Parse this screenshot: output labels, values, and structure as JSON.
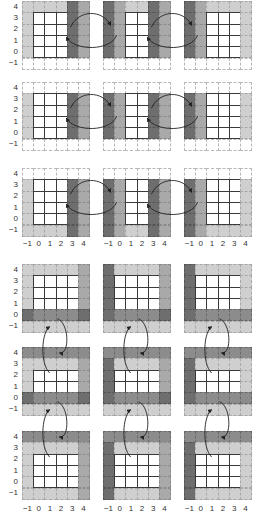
{
  "figure": {
    "axis": {
      "x_ticks": [
        "−1",
        "0",
        "1",
        "2",
        "3",
        "4"
      ],
      "y_ticks": [
        "4",
        "3",
        "2",
        "1",
        "0",
        "−1"
      ]
    },
    "colors": {
      "white": "#ffffff",
      "light": "#cfcfcf",
      "medium": "#a9a9a9",
      "dark": "#6e6e6e",
      "line": "#3a3a3a",
      "arrow": "#222222"
    },
    "grid_origin_x": [
      22,
      103,
      184
    ],
    "cell_w": 11.2,
    "cell_h": 11.3,
    "top_section": {
      "row_y": [
        1,
        82,
        168
      ],
      "xlabel_y": 240,
      "swap_direction": "horizontal",
      "rows": [
        {
          "grids": [
            [
              [
                "1",
                "1",
                "1",
                "1",
                "3",
                "2"
              ],
              [
                "1",
                "W",
                "W",
                "W",
                "3",
                "2"
              ],
              [
                "1",
                "W",
                "W",
                "W",
                "3",
                "2"
              ],
              [
                "1",
                "W",
                "W",
                "W",
                "3",
                "2"
              ],
              [
                "1",
                "W",
                "W",
                "W",
                "3",
                "2"
              ],
              [
                "0",
                "0",
                "0",
                "0",
                "0",
                "0"
              ]
            ],
            [
              [
                "3",
                "2",
                "1",
                "1",
                "3",
                "2"
              ],
              [
                "3",
                "2",
                "W",
                "W",
                "3",
                "2"
              ],
              [
                "3",
                "2",
                "W",
                "W",
                "3",
                "2"
              ],
              [
                "3",
                "2",
                "W",
                "W",
                "3",
                "2"
              ],
              [
                "3",
                "2",
                "W",
                "W",
                "3",
                "2"
              ],
              [
                "0",
                "0",
                "0",
                "0",
                "0",
                "0"
              ]
            ],
            [
              [
                "3",
                "2",
                "1",
                "1",
                "1",
                "1"
              ],
              [
                "3",
                "2",
                "W",
                "W",
                "W",
                "1"
              ],
              [
                "3",
                "2",
                "W",
                "W",
                "W",
                "1"
              ],
              [
                "3",
                "2",
                "W",
                "W",
                "W",
                "1"
              ],
              [
                "3",
                "2",
                "W",
                "W",
                "W",
                "1"
              ],
              [
                "0",
                "0",
                "0",
                "0",
                "0",
                "0"
              ]
            ]
          ]
        },
        {
          "grids": [
            [
              [
                "0",
                "0",
                "0",
                "0",
                "0",
                "0"
              ],
              [
                "1",
                "W",
                "W",
                "W",
                "3",
                "2"
              ],
              [
                "1",
                "W",
                "W",
                "W",
                "3",
                "2"
              ],
              [
                "1",
                "W",
                "W",
                "W",
                "3",
                "2"
              ],
              [
                "1",
                "W",
                "W",
                "W",
                "3",
                "2"
              ],
              [
                "0",
                "0",
                "0",
                "0",
                "0",
                "0"
              ]
            ],
            [
              [
                "0",
                "0",
                "0",
                "0",
                "0",
                "0"
              ],
              [
                "3",
                "2",
                "W",
                "W",
                "3",
                "2"
              ],
              [
                "3",
                "2",
                "W",
                "W",
                "3",
                "2"
              ],
              [
                "3",
                "2",
                "W",
                "W",
                "3",
                "2"
              ],
              [
                "3",
                "2",
                "W",
                "W",
                "3",
                "2"
              ],
              [
                "0",
                "0",
                "0",
                "0",
                "0",
                "0"
              ]
            ],
            [
              [
                "0",
                "0",
                "0",
                "0",
                "0",
                "0"
              ],
              [
                "3",
                "2",
                "W",
                "W",
                "W",
                "1"
              ],
              [
                "3",
                "2",
                "W",
                "W",
                "W",
                "1"
              ],
              [
                "3",
                "2",
                "W",
                "W",
                "W",
                "1"
              ],
              [
                "3",
                "2",
                "W",
                "W",
                "W",
                "1"
              ],
              [
                "0",
                "0",
                "0",
                "0",
                "0",
                "0"
              ]
            ]
          ]
        },
        {
          "grids": [
            [
              [
                "0",
                "0",
                "0",
                "0",
                "0",
                "0"
              ],
              [
                "1",
                "W",
                "W",
                "W",
                "3",
                "2"
              ],
              [
                "1",
                "W",
                "W",
                "W",
                "3",
                "2"
              ],
              [
                "1",
                "W",
                "W",
                "W",
                "3",
                "2"
              ],
              [
                "1",
                "W",
                "W",
                "W",
                "3",
                "2"
              ],
              [
                "1",
                "1",
                "1",
                "1",
                "3",
                "2"
              ]
            ],
            [
              [
                "0",
                "0",
                "0",
                "0",
                "0",
                "0"
              ],
              [
                "3",
                "2",
                "W",
                "W",
                "3",
                "2"
              ],
              [
                "3",
                "2",
                "W",
                "W",
                "3",
                "2"
              ],
              [
                "3",
                "2",
                "W",
                "W",
                "3",
                "2"
              ],
              [
                "3",
                "2",
                "W",
                "W",
                "3",
                "2"
              ],
              [
                "3",
                "2",
                "1",
                "1",
                "3",
                "2"
              ]
            ],
            [
              [
                "0",
                "0",
                "0",
                "0",
                "0",
                "0"
              ],
              [
                "3",
                "2",
                "W",
                "W",
                "W",
                "1"
              ],
              [
                "3",
                "2",
                "W",
                "W",
                "W",
                "1"
              ],
              [
                "3",
                "2",
                "W",
                "W",
                "W",
                "1"
              ],
              [
                "3",
                "2",
                "W",
                "W",
                "W",
                "1"
              ],
              [
                "3",
                "2",
                "1",
                "1",
                "1",
                "1"
              ]
            ]
          ]
        }
      ]
    },
    "bottom_section": {
      "row_y": [
        264,
        347,
        431
      ],
      "xlabel_y": 505,
      "swap_direction": "vertical",
      "rows": [
        {
          "grids": [
            [
              [
                "1",
                "1",
                "1",
                "1",
                "1",
                "2"
              ],
              [
                "1",
                "W",
                "W",
                "W",
                "W",
                "2"
              ],
              [
                "1",
                "W",
                "W",
                "W",
                "W",
                "2"
              ],
              [
                "1",
                "W",
                "W",
                "W",
                "W",
                "2"
              ],
              [
                "3",
                "4",
                "4",
                "4",
                "4",
                "3"
              ],
              [
                "1",
                "1",
                "1",
                "1",
                "1",
                "1"
              ]
            ],
            [
              [
                "3",
                "1",
                "1",
                "1",
                "1",
                "2"
              ],
              [
                "3",
                "W",
                "W",
                "W",
                "W",
                "2"
              ],
              [
                "3",
                "W",
                "W",
                "W",
                "W",
                "2"
              ],
              [
                "3",
                "W",
                "W",
                "W",
                "W",
                "2"
              ],
              [
                "3",
                "4",
                "4",
                "4",
                "4",
                "3"
              ],
              [
                "1",
                "1",
                "1",
                "1",
                "1",
                "1"
              ]
            ],
            [
              [
                "3",
                "1",
                "1",
                "1",
                "1",
                "1"
              ],
              [
                "3",
                "W",
                "W",
                "W",
                "W",
                "1"
              ],
              [
                "3",
                "W",
                "W",
                "W",
                "W",
                "1"
              ],
              [
                "3",
                "W",
                "W",
                "W",
                "W",
                "1"
              ],
              [
                "3",
                "4",
                "4",
                "4",
                "4",
                "4"
              ],
              [
                "1",
                "1",
                "1",
                "1",
                "1",
                "1"
              ]
            ]
          ]
        },
        {
          "grids": [
            [
              [
                "4",
                "4",
                "4",
                "4",
                "4",
                "4"
              ],
              [
                "1",
                "1",
                "1",
                "1",
                "1",
                "2"
              ],
              [
                "1",
                "W",
                "W",
                "W",
                "W",
                "2"
              ],
              [
                "1",
                "W",
                "W",
                "W",
                "W",
                "2"
              ],
              [
                "3",
                "4",
                "4",
                "4",
                "4",
                "3"
              ],
              [
                "1",
                "1",
                "1",
                "1",
                "1",
                "1"
              ]
            ],
            [
              [
                "4",
                "4",
                "4",
                "4",
                "4",
                "4"
              ],
              [
                "3",
                "1",
                "1",
                "1",
                "1",
                "2"
              ],
              [
                "3",
                "W",
                "W",
                "W",
                "W",
                "2"
              ],
              [
                "3",
                "W",
                "W",
                "W",
                "W",
                "2"
              ],
              [
                "3",
                "4",
                "4",
                "4",
                "4",
                "3"
              ],
              [
                "1",
                "1",
                "1",
                "1",
                "1",
                "1"
              ]
            ],
            [
              [
                "4",
                "4",
                "4",
                "4",
                "4",
                "4"
              ],
              [
                "3",
                "1",
                "1",
                "1",
                "1",
                "1"
              ],
              [
                "3",
                "W",
                "W",
                "W",
                "W",
                "1"
              ],
              [
                "3",
                "W",
                "W",
                "W",
                "W",
                "1"
              ],
              [
                "3",
                "4",
                "4",
                "4",
                "4",
                "4"
              ],
              [
                "1",
                "1",
                "1",
                "1",
                "1",
                "1"
              ]
            ]
          ]
        },
        {
          "grids": [
            [
              [
                "4",
                "4",
                "4",
                "4",
                "4",
                "4"
              ],
              [
                "1",
                "1",
                "1",
                "1",
                "1",
                "2"
              ],
              [
                "1",
                "W",
                "W",
                "W",
                "W",
                "2"
              ],
              [
                "1",
                "W",
                "W",
                "W",
                "W",
                "2"
              ],
              [
                "1",
                "W",
                "W",
                "W",
                "W",
                "2"
              ],
              [
                "1",
                "1",
                "1",
                "1",
                "1",
                "2"
              ]
            ],
            [
              [
                "4",
                "4",
                "4",
                "4",
                "4",
                "4"
              ],
              [
                "3",
                "1",
                "1",
                "1",
                "1",
                "2"
              ],
              [
                "3",
                "W",
                "W",
                "W",
                "W",
                "2"
              ],
              [
                "3",
                "W",
                "W",
                "W",
                "W",
                "2"
              ],
              [
                "3",
                "W",
                "W",
                "W",
                "W",
                "2"
              ],
              [
                "3",
                "1",
                "1",
                "1",
                "1",
                "2"
              ]
            ],
            [
              [
                "4",
                "4",
                "4",
                "4",
                "4",
                "4"
              ],
              [
                "3",
                "1",
                "1",
                "1",
                "1",
                "1"
              ],
              [
                "3",
                "W",
                "W",
                "W",
                "W",
                "1"
              ],
              [
                "3",
                "W",
                "W",
                "W",
                "W",
                "1"
              ],
              [
                "3",
                "W",
                "W",
                "W",
                "W",
                "1"
              ],
              [
                "3",
                "1",
                "1",
                "1",
                "1",
                "1"
              ]
            ]
          ]
        }
      ]
    }
  }
}
